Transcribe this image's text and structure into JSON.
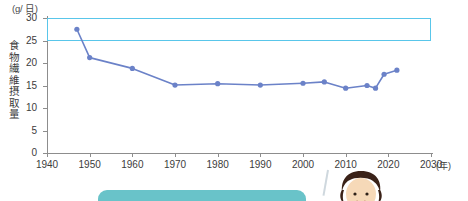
{
  "chart_data": {
    "type": "line",
    "title": "",
    "xlabel": "年",
    "ylabel": "食物繊維摂取量",
    "unit_label": "(g/ 日)",
    "x_axis_unit": "(年)",
    "xlim": [
      1940,
      2030
    ],
    "ylim": [
      0,
      30
    ],
    "grid": false,
    "legend": "none",
    "x_ticks": [
      1940,
      1950,
      1960,
      1970,
      1980,
      1990,
      2000,
      2010,
      2020,
      2030
    ],
    "y_ticks": [
      0,
      5,
      10,
      15,
      20,
      25,
      30
    ],
    "series": [
      {
        "name": "食物繊維摂取量",
        "color": "#6b82c8",
        "x": [
          1947,
          1950,
          1960,
          1970,
          1980,
          1990,
          2000,
          2005,
          2010,
          2015,
          2017,
          2019,
          2022
        ],
        "values": [
          27.5,
          21.2,
          18.8,
          15.1,
          15.4,
          15.1,
          15.5,
          15.8,
          14.4,
          15.0,
          14.4,
          17.5,
          18.4
        ]
      }
    ],
    "annotations": [
      {
        "name": "target-intake-band",
        "type": "rect",
        "x0": 1940,
        "x1": 2030,
        "y0": 25,
        "y1": 30,
        "color": "#59c6ea"
      }
    ]
  },
  "axes": {
    "unit_label": "(g/ 日)",
    "y_title": "食物繊維摂取量",
    "x_unit": "(年)",
    "y_tick_labels": [
      "30",
      "25",
      "20",
      "15",
      "10",
      "5",
      "0"
    ],
    "x_tick_labels": [
      "1940",
      "1950",
      "1960",
      "1970",
      "1980",
      "1990",
      "2000",
      "2010",
      "2020",
      "2030"
    ]
  },
  "decorations": {
    "speech_bubble_color": "#69c3c9",
    "character_hair_color": "#3a2218",
    "character_skin_color": "#f6d9b8"
  }
}
